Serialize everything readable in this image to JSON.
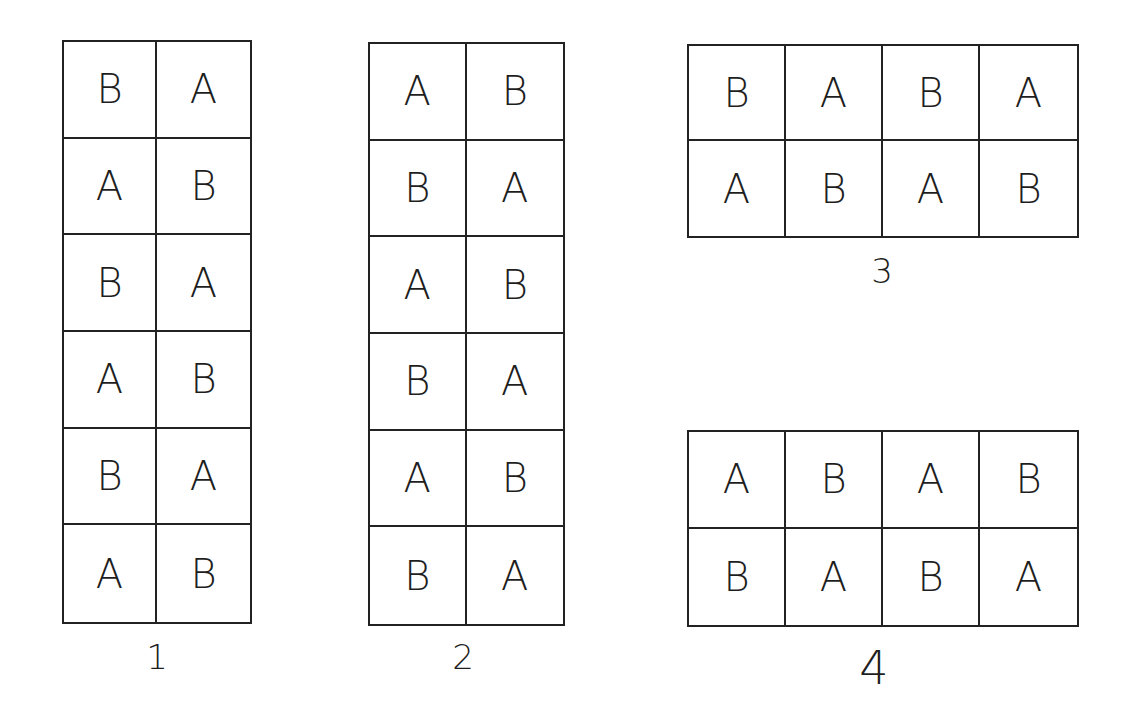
{
  "figure": {
    "line_color": "#222222",
    "background": "#ffffff"
  },
  "grids": [
    {
      "label": "1",
      "rows": 6,
      "cols": 2,
      "cells": [
        [
          "B",
          "A"
        ],
        [
          "A",
          "B"
        ],
        [
          "B",
          "A"
        ],
        [
          "A",
          "B"
        ],
        [
          "B",
          "A"
        ],
        [
          "A",
          "B"
        ]
      ]
    },
    {
      "label": "2",
      "rows": 6,
      "cols": 2,
      "cells": [
        [
          "A",
          "B"
        ],
        [
          "B",
          "A"
        ],
        [
          "A",
          "B"
        ],
        [
          "B",
          "A"
        ],
        [
          "A",
          "B"
        ],
        [
          "B",
          "A"
        ]
      ]
    },
    {
      "label": "3",
      "rows": 2,
      "cols": 4,
      "cells": [
        [
          "B",
          "A",
          "B",
          "A"
        ],
        [
          "A",
          "B",
          "A",
          "B"
        ]
      ]
    },
    {
      "label": "4",
      "rows": 2,
      "cols": 4,
      "cells": [
        [
          "A",
          "B",
          "A",
          "B"
        ],
        [
          "B",
          "A",
          "B",
          "A"
        ]
      ]
    }
  ]
}
